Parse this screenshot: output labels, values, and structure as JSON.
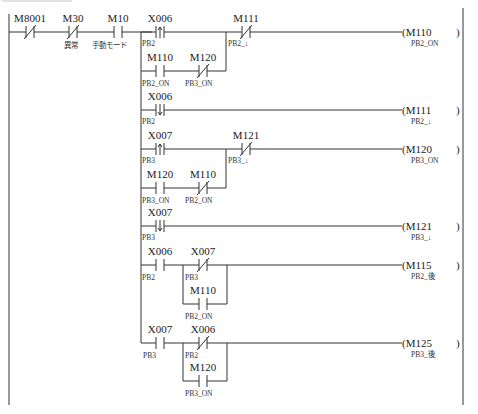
{
  "diagram": {
    "type": "ladder",
    "header_rung": {
      "contacts": [
        {
          "device": "M8001",
          "kind": "nc",
          "comment": ""
        },
        {
          "device": "M30",
          "kind": "nc",
          "comment": "異常"
        },
        {
          "device": "M10",
          "kind": "no",
          "comment": "手動モード"
        }
      ]
    },
    "rungs": [
      {
        "coil": {
          "device": "M110",
          "comment": "PB2_ON"
        },
        "main": [
          {
            "device": "X006",
            "kind": "rising",
            "comment": "PB2"
          }
        ],
        "branch": [
          {
            "device": "M110",
            "kind": "no",
            "comment": "PB2_ON"
          },
          {
            "device": "M120",
            "kind": "nc",
            "comment": "PB3_ON"
          }
        ],
        "series": [
          {
            "device": "M111",
            "kind": "nc",
            "comment": "PB2_↓"
          }
        ]
      },
      {
        "coil": {
          "device": "M111",
          "comment": "PB2_↓"
        },
        "main": [
          {
            "device": "X006",
            "kind": "falling",
            "comment": "PB2"
          }
        ]
      },
      {
        "coil": {
          "device": "M120",
          "comment": "PB3_ON"
        },
        "main": [
          {
            "device": "X007",
            "kind": "rising",
            "comment": "PB3"
          }
        ],
        "branch": [
          {
            "device": "M120",
            "kind": "no",
            "comment": "PB3_ON"
          },
          {
            "device": "M110",
            "kind": "nc",
            "comment": "PB2_ON"
          }
        ],
        "series": [
          {
            "device": "M121",
            "kind": "nc",
            "comment": "PB3_↓"
          }
        ]
      },
      {
        "coil": {
          "device": "M121",
          "comment": "PB3_↓"
        },
        "main": [
          {
            "device": "X007",
            "kind": "falling",
            "comment": "PB3"
          }
        ]
      },
      {
        "coil": {
          "device": "M115",
          "comment": "PB2_後"
        },
        "main": [
          {
            "device": "X006",
            "kind": "no",
            "comment": "PB2"
          },
          {
            "device": "X007",
            "kind": "nc",
            "comment": "PB3"
          }
        ],
        "parallel": {
          "device": "M110",
          "kind": "no",
          "comment": "PB2_ON"
        }
      },
      {
        "coil": {
          "device": "M125",
          "comment": "PB3_後"
        },
        "main": [
          {
            "device": "X007",
            "kind": "no",
            "comment": "PB3"
          },
          {
            "device": "X006",
            "kind": "nc",
            "comment": "PB2"
          }
        ],
        "parallel": {
          "device": "M120",
          "kind": "no",
          "comment": "PB3_ON"
        }
      }
    ]
  }
}
